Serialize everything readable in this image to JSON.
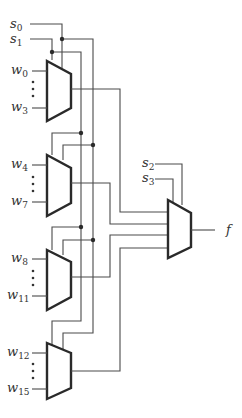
{
  "diagram": {
    "type": "16-to-1 multiplexer built from five 4-to-1 multiplexers",
    "colors": {
      "wire": "#4a4a4a",
      "mux_outline": "#2a2a2a",
      "background": "#ffffff"
    },
    "select_inputs_stage1": [
      {
        "base": "s",
        "sub": "0"
      },
      {
        "base": "s",
        "sub": "1"
      }
    ],
    "select_inputs_stage2": [
      {
        "base": "s",
        "sub": "2"
      },
      {
        "base": "s",
        "sub": "3"
      }
    ],
    "muxes": [
      {
        "name": "mux-0",
        "inputs": [
          {
            "base": "w",
            "sub": "0"
          },
          {
            "base": "w",
            "sub": "3"
          }
        ]
      },
      {
        "name": "mux-1",
        "inputs": [
          {
            "base": "w",
            "sub": "4"
          },
          {
            "base": "w",
            "sub": "7"
          }
        ]
      },
      {
        "name": "mux-2",
        "inputs": [
          {
            "base": "w",
            "sub": "8"
          },
          {
            "base": "w",
            "sub": "11"
          }
        ]
      },
      {
        "name": "mux-3",
        "inputs": [
          {
            "base": "w",
            "sub": "12"
          },
          {
            "base": "w",
            "sub": "15"
          }
        ]
      }
    ],
    "output": {
      "label": "f"
    }
  }
}
